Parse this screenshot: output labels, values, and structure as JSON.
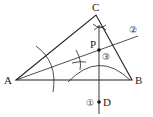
{
  "diagram": {
    "type": "geometric-construction",
    "points": {
      "A": {
        "label": "A",
        "x": 16,
        "y": 80
      },
      "B": {
        "label": "B",
        "x": 132,
        "y": 80
      },
      "C": {
        "label": "C",
        "x": 96,
        "y": 15
      },
      "P": {
        "label": "P",
        "x": 99,
        "y": 50
      },
      "D": {
        "label": "D",
        "x": 99,
        "y": 102
      }
    },
    "step_labels": {
      "step1": "①",
      "step2": "②",
      "step3": "③"
    },
    "colors": {
      "line": "#222222",
      "background": "#ffffff"
    }
  }
}
